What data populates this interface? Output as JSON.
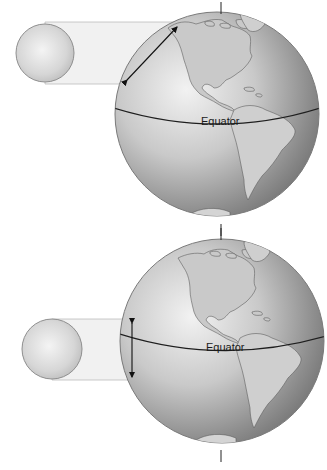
{
  "diagram": {
    "panels": [
      {
        "id": "top",
        "equator_label": "Equator",
        "arrow": "diagonal",
        "colors": {
          "globe_light": "#d8d8d8",
          "globe_dark": "#7a7a7a",
          "land": "#c8c8c8",
          "beam": "#f1f1f1",
          "outline": "#9a9a9a"
        }
      },
      {
        "id": "bottom",
        "equator_label": "Equator",
        "arrow": "vertical",
        "colors": {
          "globe_light": "#d8d8d8",
          "globe_dark": "#7a7a7a",
          "land": "#c8c8c8",
          "beam": "#f1f1f1",
          "outline": "#9a9a9a"
        }
      }
    ]
  }
}
